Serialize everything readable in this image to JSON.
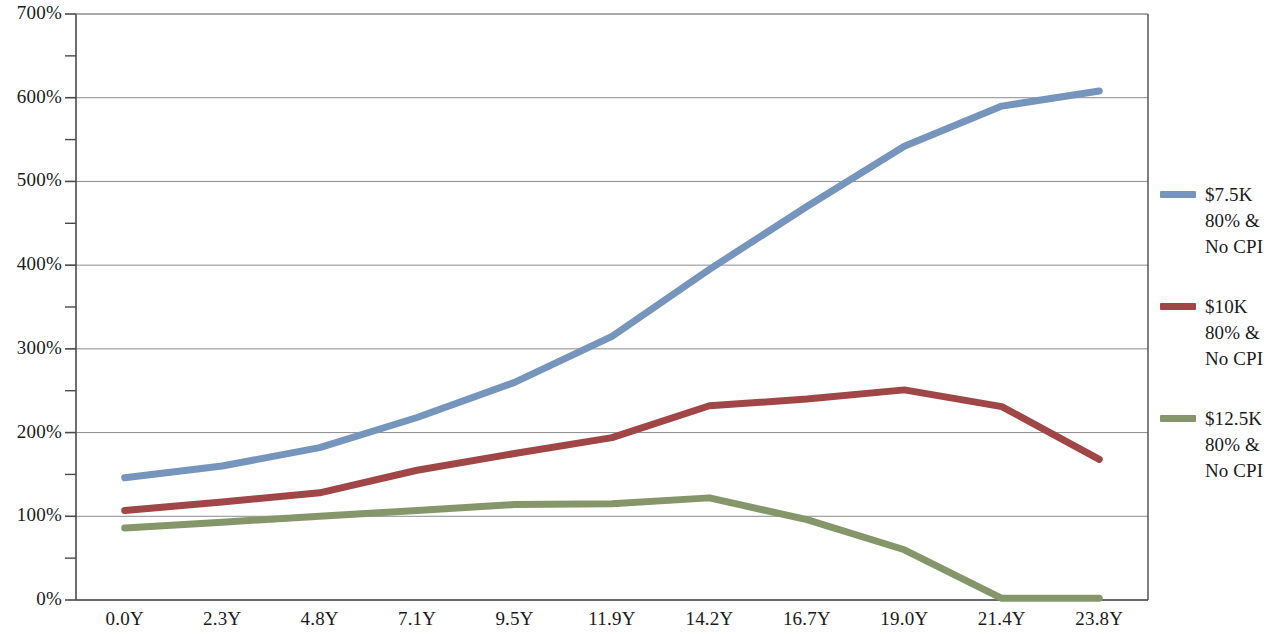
{
  "chart_data": {
    "type": "line",
    "title": "",
    "subtitle": "",
    "xlabel": "",
    "ylabel": "",
    "categories": [
      "0.0Y",
      "2.3Y",
      "4.8Y",
      "7.1Y",
      "9.5Y",
      "11.9Y",
      "14.2Y",
      "16.7Y",
      "19.0Y",
      "21.4Y",
      "23.8Y"
    ],
    "y_tick_labels": [
      "0%",
      "100%",
      "200%",
      "300%",
      "400%",
      "500%",
      "600%",
      "700%"
    ],
    "y_tick_values": [
      0,
      100,
      200,
      300,
      400,
      500,
      600,
      700
    ],
    "ylim": [
      0,
      700
    ],
    "y_minor_ticks": [
      50,
      150,
      250,
      350,
      450,
      550,
      650
    ],
    "grid": "horizontal",
    "legend_position": "right",
    "series": [
      {
        "name": "$7.5K\n80% &\nNo CPI",
        "color": "#7695bd",
        "values": [
          146,
          160,
          182,
          218,
          260,
          315,
          395,
          470,
          542,
          590,
          608
        ]
      },
      {
        "name": "$10K\n80% &\nNo CPI",
        "color": "#a04647",
        "values": [
          107,
          117,
          128,
          155,
          175,
          194,
          232,
          240,
          251,
          231,
          168
        ]
      },
      {
        "name": "$12.5K\n80% &\nNo CPI",
        "color": "#85976a",
        "values": [
          86,
          93,
          100,
          107,
          114,
          115,
          122,
          96,
          60,
          2,
          2
        ]
      }
    ]
  },
  "legend": {
    "entries": [
      {
        "label": "$7.5K\n80% &\nNo CPI",
        "color": "#7695bd"
      },
      {
        "label": "$10K\n80% &\nNo CPI",
        "color": "#a04647"
      },
      {
        "label": "$12.5K\n80% &\nNo CPI",
        "color": "#85976a"
      }
    ]
  },
  "axes": {
    "axis_color": "#4a4a4a",
    "grid_color": "#8c8c8c"
  }
}
